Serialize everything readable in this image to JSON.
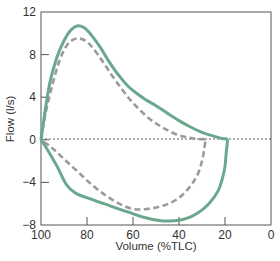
{
  "chart_data": {
    "type": "line",
    "title": "",
    "xlabel": "Volume (%TLC)",
    "ylabel": "Flow (l/s)",
    "xlim": [
      100,
      0
    ],
    "ylim": [
      -8,
      12
    ],
    "x_reversed": true,
    "x_ticks": [
      100,
      80,
      60,
      40,
      20,
      0
    ],
    "y_ticks": [
      12,
      8,
      4,
      0,
      -4,
      -8
    ],
    "x_tick_labels": [
      "100",
      "80",
      "60",
      "40",
      "20",
      "0"
    ],
    "y_tick_labels": [
      "12",
      "8",
      "4",
      "0",
      "-4",
      "-8"
    ],
    "grid": false,
    "zero_line": {
      "y": 0,
      "style": "dashed",
      "color": "#333333"
    },
    "legend": null,
    "series": [
      {
        "name": "solid-loop",
        "style": "solid",
        "color": "#6aa88e",
        "points": [
          [
            100,
            0
          ],
          [
            98,
            3
          ],
          [
            96,
            5.5
          ],
          [
            93,
            7.8
          ],
          [
            90,
            9.3
          ],
          [
            87,
            10.3
          ],
          [
            84,
            10.7
          ],
          [
            81,
            10.5
          ],
          [
            78,
            9.8
          ],
          [
            74,
            8.6
          ],
          [
            70,
            7.2
          ],
          [
            66,
            6.0
          ],
          [
            62,
            5.0
          ],
          [
            58,
            4.3
          ],
          [
            54,
            3.7
          ],
          [
            50,
            3.2
          ],
          [
            45,
            2.5
          ],
          [
            40,
            1.8
          ],
          [
            35,
            1.2
          ],
          [
            30,
            0.7
          ],
          [
            25,
            0.35
          ],
          [
            21,
            0.1
          ],
          [
            19,
            0
          ],
          [
            19.5,
            -1.2
          ],
          [
            20,
            -2.5
          ],
          [
            21,
            -3.5
          ],
          [
            23,
            -4.8
          ],
          [
            27,
            -6.0
          ],
          [
            32,
            -6.9
          ],
          [
            37,
            -7.4
          ],
          [
            42,
            -7.6
          ],
          [
            48,
            -7.6
          ],
          [
            55,
            -7.3
          ],
          [
            62,
            -6.8
          ],
          [
            70,
            -6.2
          ],
          [
            78,
            -5.6
          ],
          [
            85,
            -5.0
          ],
          [
            89,
            -4.2
          ],
          [
            93,
            -2.5
          ],
          [
            97,
            -1.0
          ],
          [
            100,
            0
          ]
        ]
      },
      {
        "name": "dashed-loop",
        "style": "dashed",
        "color": "#9a9a9a",
        "points": [
          [
            100,
            0
          ],
          [
            98,
            2.5
          ],
          [
            95,
            5.2
          ],
          [
            92,
            7.4
          ],
          [
            89,
            8.8
          ],
          [
            86,
            9.4
          ],
          [
            83,
            9.5
          ],
          [
            80,
            9.2
          ],
          [
            77,
            8.5
          ],
          [
            73,
            7.3
          ],
          [
            69,
            6.0
          ],
          [
            65,
            4.8
          ],
          [
            61,
            3.7
          ],
          [
            57,
            2.8
          ],
          [
            53,
            2.0
          ],
          [
            49,
            1.4
          ],
          [
            45,
            0.9
          ],
          [
            41,
            0.5
          ],
          [
            37,
            0.25
          ],
          [
            33,
            0.1
          ],
          [
            29,
            0.05
          ],
          [
            28.5,
            0
          ],
          [
            29,
            -0.8
          ],
          [
            30,
            -2.0
          ],
          [
            32,
            -3.3
          ],
          [
            36,
            -4.6
          ],
          [
            41,
            -5.6
          ],
          [
            47,
            -6.2
          ],
          [
            54,
            -6.5
          ],
          [
            60,
            -6.5
          ],
          [
            66,
            -6.0
          ],
          [
            72,
            -5.2
          ],
          [
            78,
            -4.2
          ],
          [
            84,
            -3.0
          ],
          [
            90,
            -1.8
          ],
          [
            95,
            -0.8
          ],
          [
            100,
            0
          ]
        ]
      }
    ]
  }
}
